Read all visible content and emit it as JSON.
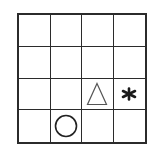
{
  "puzzle": {
    "rows": 4,
    "cols": 4,
    "line_color": "#2b2b2b",
    "cells": [
      [
        {
          "symbol": ""
        },
        {
          "symbol": ""
        },
        {
          "symbol": ""
        },
        {
          "symbol": ""
        }
      ],
      [
        {
          "symbol": ""
        },
        {
          "symbol": ""
        },
        {
          "symbol": ""
        },
        {
          "symbol": ""
        }
      ],
      [
        {
          "symbol": ""
        },
        {
          "symbol": ""
        },
        {
          "symbol": "triangle-icon"
        },
        {
          "symbol": "asterisk-icon"
        }
      ],
      [
        {
          "symbol": ""
        },
        {
          "symbol": "circle-icon"
        },
        {
          "symbol": ""
        },
        {
          "symbol": ""
        }
      ]
    ]
  }
}
